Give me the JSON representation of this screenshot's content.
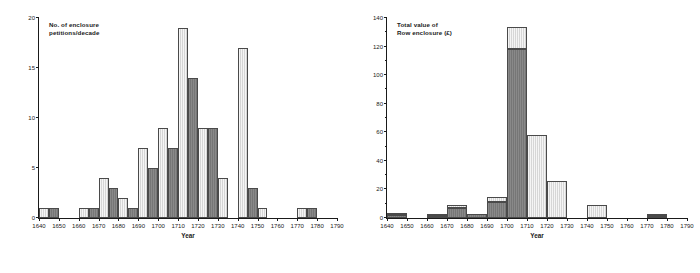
{
  "figure": {
    "panels": [
      "left",
      "right"
    ]
  },
  "chart_data": [
    {
      "type": "bar",
      "panel": "left",
      "title": "No. of enclosure\npetitions/decade",
      "xlabel": "Year",
      "ylabel": "",
      "ylim": [
        0,
        20
      ],
      "yticks": [
        0,
        5,
        10,
        15,
        20
      ],
      "ytick_labels": [
        "0",
        "5",
        "10",
        "15",
        "20"
      ],
      "xlim": [
        1640,
        1790
      ],
      "xticks": [
        1640,
        1650,
        1660,
        1670,
        1680,
        1690,
        1700,
        1710,
        1720,
        1730,
        1740,
        1750,
        1760,
        1770,
        1780,
        1790
      ],
      "xtick_labels": [
        "1640",
        "1650",
        "1660",
        "1670",
        "1680",
        "1690",
        "1700",
        "1710",
        "1720",
        "1730",
        "1740",
        "1750",
        "1760",
        "1770",
        "1780",
        "1790"
      ],
      "grid": false,
      "legend": "none",
      "categories": [
        "1640",
        "1650",
        "1660",
        "1670",
        "1680",
        "1690",
        "1700",
        "1710",
        "1720",
        "1730",
        "1740",
        "1750",
        "1760",
        "1770",
        "1780"
      ],
      "series": [
        {
          "name": "light",
          "color": "#d6d6d6",
          "values": [
            1,
            0,
            1,
            4,
            2,
            7,
            9,
            19,
            9,
            4,
            17,
            1,
            0,
            1,
            0
          ]
        },
        {
          "name": "dark",
          "color": "#767676",
          "values": [
            1,
            0,
            1,
            3,
            1,
            5,
            7,
            14,
            9,
            0,
            3,
            0,
            0,
            1,
            0
          ]
        }
      ]
    },
    {
      "type": "bar",
      "panel": "right",
      "title": "Total value of\nRow enclosure (£)",
      "xlabel": "Year",
      "ylabel": "",
      "ylim": [
        0,
        140
      ],
      "yticks": [
        0,
        20,
        40,
        60,
        80,
        100,
        120,
        140
      ],
      "ytick_labels": [
        "0",
        "20",
        "40",
        "60",
        "80",
        "100",
        "120",
        "140"
      ],
      "yminor_ticks": [
        10,
        30,
        50,
        70,
        90,
        110,
        130
      ],
      "xlim": [
        1640,
        1790
      ],
      "xticks": [
        1640,
        1650,
        1660,
        1670,
        1680,
        1690,
        1700,
        1710,
        1720,
        1730,
        1740,
        1750,
        1760,
        1770,
        1780,
        1790
      ],
      "xtick_labels": [
        "1640",
        "1650",
        "1660",
        "1670",
        "1680",
        "1690",
        "1700",
        "1710",
        "1720",
        "1730",
        "1740",
        "1750",
        "1760",
        "1770",
        "1780",
        "1790"
      ],
      "grid": false,
      "legend": "none",
      "stacked": true,
      "categories": [
        "1640",
        "1650",
        "1660",
        "1670",
        "1680",
        "1690",
        "1700",
        "1710",
        "1720",
        "1730",
        "1740",
        "1750",
        "1760",
        "1770",
        "1780"
      ],
      "series": [
        {
          "name": "dark",
          "color": "#767676",
          "values": [
            2,
            0,
            1.5,
            7,
            3,
            11,
            118,
            0,
            0,
            0,
            0,
            0,
            0,
            1.5,
            0
          ]
        },
        {
          "name": "light",
          "color": "#d6d6d6",
          "values": [
            1,
            0,
            0.5,
            2,
            0,
            4,
            16,
            58,
            26,
            0,
            9,
            0,
            0,
            0.5,
            0
          ]
        }
      ],
      "totals": [
        3,
        0,
        2,
        9,
        3,
        15,
        134,
        58,
        26,
        0,
        9,
        0,
        0,
        2,
        0
      ]
    }
  ]
}
